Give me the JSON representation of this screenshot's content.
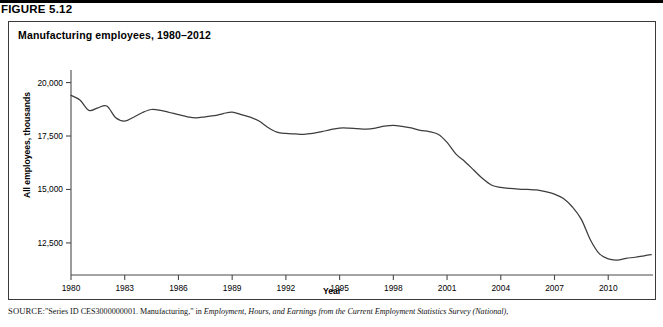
{
  "figure": {
    "number": "FIGURE 5.12",
    "title": "Manufacturing employees, 1980–2012"
  },
  "source": {
    "label": "SOURCE:",
    "text_part1": "\"Series ID CES3000000001. Manufacturing,\" in ",
    "text_italic": "Employment, Hours, and Earnings from the Current Employment Statistics Survey (National)",
    "text_part2": ","
  },
  "chart_data": {
    "type": "line",
    "title": "Manufacturing employees, 1980–2012",
    "xlabel": "Year",
    "ylabel": "All employees, thousands",
    "xlim": [
      1980,
      2012.5
    ],
    "ylim": [
      11000,
      20400
    ],
    "grid": false,
    "legend": null,
    "xticks": [
      1980,
      1983,
      1986,
      1989,
      1992,
      1995,
      1998,
      2001,
      2004,
      2007,
      2010
    ],
    "xtick_labels": [
      "1980",
      "1983",
      "1986",
      "1989",
      "1992",
      "1995",
      "1998",
      "2001",
      "2004",
      "2007",
      "2010"
    ],
    "yticks": [
      12500,
      15000,
      17500,
      20000
    ],
    "ytick_labels": [
      "12,500",
      "15,000",
      "17,500",
      "20,000"
    ],
    "series": [
      {
        "name": "All employees, manufacturing (thousands)",
        "color": "#3d3d3d",
        "x": [
          1980,
          1980.5,
          1981,
          1981.5,
          1982,
          1982.5,
          1983,
          1983.5,
          1984,
          1984.5,
          1985,
          1985.5,
          1986,
          1986.5,
          1987,
          1987.5,
          1988,
          1988.5,
          1989,
          1989.5,
          1990,
          1990.5,
          1991,
          1991.5,
          1992,
          1992.5,
          1993,
          1993.5,
          1994,
          1994.5,
          1995,
          1995.5,
          1996,
          1996.5,
          1997,
          1997.5,
          1998,
          1998.5,
          1999,
          1999.5,
          2000,
          2000.5,
          2001,
          2001.5,
          2002,
          2002.5,
          2003,
          2003.5,
          2004,
          2004.5,
          2005,
          2005.5,
          2006,
          2006.5,
          2007,
          2007.5,
          2008,
          2008.5,
          2009,
          2009.5,
          2010,
          2010.5,
          2011,
          2011.5,
          2012,
          2012.4
        ],
        "y": [
          19400,
          19180,
          18700,
          18820,
          18900,
          18350,
          18200,
          18380,
          18600,
          18740,
          18700,
          18600,
          18500,
          18400,
          18350,
          18400,
          18450,
          18550,
          18620,
          18500,
          18380,
          18200,
          17900,
          17680,
          17620,
          17600,
          17580,
          17620,
          17700,
          17800,
          17870,
          17870,
          17840,
          17820,
          17870,
          17960,
          18000,
          17950,
          17880,
          17760,
          17710,
          17580,
          17200,
          16650,
          16300,
          15900,
          15500,
          15200,
          15100,
          15050,
          15020,
          15000,
          14980,
          14900,
          14780,
          14580,
          14180,
          13600,
          12650,
          12000,
          11750,
          11700,
          11780,
          11830,
          11900,
          11950
        ],
        "annotations": [
          {
            "label": "1980 start",
            "x": 1980,
            "y": 19400
          },
          {
            "label": "1982-83 recession trough",
            "x": 1983,
            "y": 18200
          },
          {
            "label": "late-1980s peak",
            "x": 1989,
            "y": 18620
          },
          {
            "label": "early-1990s trough",
            "x": 1993,
            "y": 17580
          },
          {
            "label": "1998 peak",
            "x": 1998,
            "y": 18000
          },
          {
            "label": "post-2001 decline",
            "x": 2003.5,
            "y": 15200
          },
          {
            "label": "mid-2000s plateau",
            "x": 2006,
            "y": 14980
          },
          {
            "label": "Great Recession trough",
            "x": 2010,
            "y": 11700
          },
          {
            "label": "2012 end",
            "x": 2012.4,
            "y": 11950
          }
        ]
      }
    ]
  }
}
